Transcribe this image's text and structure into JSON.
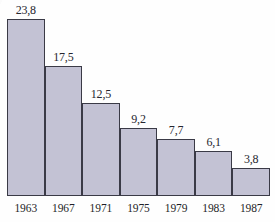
{
  "chart_data": {
    "type": "bar",
    "title": "",
    "xlabel": "",
    "ylabel": "",
    "categories": [
      "1963",
      "1967",
      "1971",
      "1975",
      "1979",
      "1983",
      "1987"
    ],
    "values": [
      23.8,
      17.5,
      12.5,
      9.2,
      7.7,
      6.1,
      3.8
    ],
    "value_labels": [
      "23,8",
      "17,5",
      "12,5",
      "9,2",
      "7,7",
      "6,1",
      "3,8"
    ],
    "ylim": [
      0,
      23.8
    ],
    "grid": false,
    "legend": null,
    "decimal_separator": ",",
    "bars": [
      {
        "category": "1963",
        "value": 23.8,
        "label": "23,8"
      },
      {
        "category": "1967",
        "value": 17.5,
        "label": "17,5"
      },
      {
        "category": "1971",
        "value": 12.5,
        "label": "12,5"
      },
      {
        "category": "1975",
        "value": 9.2,
        "label": "9,2"
      },
      {
        "category": "1979",
        "value": 7.7,
        "label": "7,7"
      },
      {
        "category": "1983",
        "value": 6.1,
        "label": "6,1"
      },
      {
        "category": "1987",
        "value": 3.8,
        "label": "3,8"
      }
    ]
  },
  "style": {
    "bar_fill": "#c3c2d4",
    "bar_border": "#3a3a46",
    "text_color": "#26262e",
    "background": "#fefefe"
  },
  "truncated_header": ""
}
